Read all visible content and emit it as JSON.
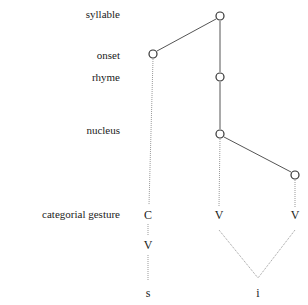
{
  "labels": {
    "syllable": "syllable",
    "onset": "onset",
    "rhyme": "rhyme",
    "nucleus": "nucleus",
    "categorial_gesture": "categorial gesture"
  },
  "symbols": {
    "onset_c": "C",
    "onset_v": "V",
    "nucleus_v1": "V",
    "nucleus_v2": "V",
    "seg_s": "s",
    "seg_i": "i"
  }
}
